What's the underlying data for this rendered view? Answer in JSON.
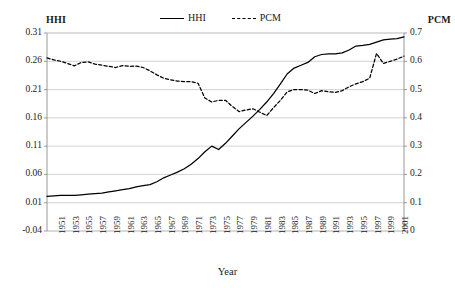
{
  "chart_data": {
    "type": "line",
    "title": "",
    "xlabel": "Year",
    "ylabel": "HHI",
    "y2label": "PCM",
    "grid": true,
    "legend_position": "top-center",
    "xlim": [
      1950,
      2002
    ],
    "ylim": [
      -0.04,
      0.31
    ],
    "y2lim": [
      0,
      0.7
    ],
    "yticks": [
      "0.31",
      "0.26",
      "0.21",
      "0.16",
      "0.11",
      "0.06",
      "0.01",
      "-0.04"
    ],
    "ytick_values": [
      0.31,
      0.26,
      0.21,
      0.16,
      0.11,
      0.06,
      0.01,
      -0.04
    ],
    "y2ticks": [
      "0.7",
      "0.6",
      "0.5",
      "0.4",
      "0.3",
      "0.2",
      "0.1",
      "0"
    ],
    "y2tick_values": [
      0.7,
      0.6,
      0.5,
      0.4,
      0.3,
      0.2,
      0.1,
      0.0
    ],
    "xticks": [
      "1951",
      "1953",
      "1955",
      "1957",
      "1959",
      "1961",
      "1963",
      "1965",
      "1967",
      "1969",
      "1971",
      "1973",
      "1975",
      "1977",
      "1979",
      "1981",
      "1983",
      "1985",
      "1987",
      "1989",
      "1991",
      "1993",
      "1995",
      "1997",
      "1999",
      "2001"
    ],
    "x": [
      1950,
      1951,
      1952,
      1953,
      1954,
      1955,
      1956,
      1957,
      1958,
      1959,
      1960,
      1961,
      1962,
      1963,
      1964,
      1965,
      1966,
      1967,
      1968,
      1969,
      1970,
      1971,
      1972,
      1973,
      1974,
      1975,
      1976,
      1977,
      1978,
      1979,
      1980,
      1981,
      1982,
      1983,
      1984,
      1985,
      1986,
      1987,
      1988,
      1989,
      1990,
      1991,
      1992,
      1993,
      1994,
      1995,
      1996,
      1997,
      1998,
      1999,
      2000,
      2001,
      2002
    ],
    "series": [
      {
        "name": "HHI",
        "axis": "left",
        "style": "solid",
        "color": "#000000",
        "values": [
          0.021,
          0.022,
          0.023,
          0.023,
          0.023,
          0.024,
          0.025,
          0.026,
          0.027,
          0.029,
          0.031,
          0.033,
          0.035,
          0.038,
          0.04,
          0.042,
          0.047,
          0.054,
          0.059,
          0.064,
          0.07,
          0.078,
          0.088,
          0.1,
          0.11,
          0.104,
          0.115,
          0.128,
          0.141,
          0.152,
          0.163,
          0.175,
          0.188,
          0.203,
          0.22,
          0.238,
          0.248,
          0.253,
          0.258,
          0.268,
          0.272,
          0.273,
          0.273,
          0.275,
          0.28,
          0.287,
          0.288,
          0.29,
          0.294,
          0.298,
          0.299,
          0.3,
          0.303
        ]
      },
      {
        "name": "PCM",
        "axis": "right",
        "style": "dashed",
        "color": "#000000",
        "values": [
          0.612,
          0.605,
          0.6,
          0.592,
          0.584,
          0.596,
          0.598,
          0.59,
          0.586,
          0.582,
          0.578,
          0.585,
          0.582,
          0.583,
          0.578,
          0.566,
          0.552,
          0.54,
          0.534,
          0.53,
          0.528,
          0.528,
          0.522,
          0.47,
          0.456,
          0.462,
          0.462,
          0.44,
          0.422,
          0.428,
          0.432,
          0.42,
          0.408,
          0.436,
          0.462,
          0.492,
          0.5,
          0.5,
          0.498,
          0.486,
          0.496,
          0.492,
          0.49,
          0.496,
          0.51,
          0.52,
          0.528,
          0.54,
          0.628,
          0.592,
          0.6,
          0.608,
          0.618
        ]
      }
    ]
  }
}
